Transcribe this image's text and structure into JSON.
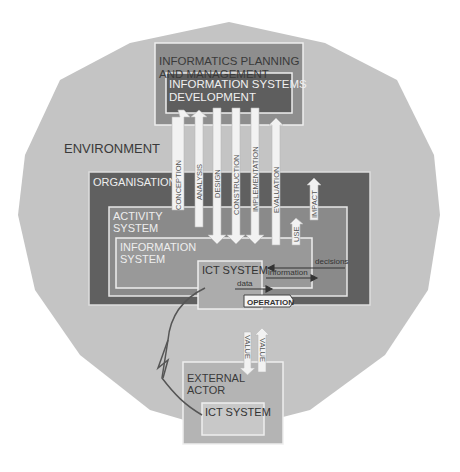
{
  "diagram": {
    "environment": {
      "label": "ENVIRONMENT"
    },
    "planning": {
      "line1": "INFORMATICS PLANNING",
      "line2": "AND MANAGEMENT"
    },
    "development": {
      "line1": "INFORMATION SYSTEMS",
      "line2": "DEVELOPMENT"
    },
    "organisation": {
      "label": "ORGANISATION"
    },
    "activity_system": {
      "line1": "ACTIVITY",
      "line2": "SYSTEM"
    },
    "information_system": {
      "line1": "INFORMATION",
      "line2": "SYSTEM"
    },
    "ict_system_inner": {
      "label": "ICT SYSTEM"
    },
    "external_actor": {
      "line1": "EXTERNAL",
      "line2": "ACTOR"
    },
    "ict_system_external": {
      "label": "ICT SYSTEM"
    },
    "phases": [
      {
        "label": "CONCEPTION",
        "direction": "up"
      },
      {
        "label": "ANALYSIS",
        "direction": "up"
      },
      {
        "label": "DESIGN",
        "direction": "down"
      },
      {
        "label": "CONSTRUCTION",
        "direction": "down"
      },
      {
        "label": "IMPLEMENTATION",
        "direction": "down"
      },
      {
        "label": "EVALUATION",
        "direction": "up"
      }
    ],
    "use": {
      "label": "USE"
    },
    "impact": {
      "label": "IMPACT"
    },
    "flows": {
      "decisions": "decisions",
      "information": "information",
      "data": "data",
      "operation": "OPERATION"
    },
    "value_arrows": [
      {
        "label": "VALUE",
        "direction": "down"
      },
      {
        "label": "VALUE",
        "direction": "up"
      }
    ],
    "colors": {
      "environment": "#c4c4c4",
      "planning": "#8e8e8e",
      "development": "#5e5e5e",
      "organisation": "#606060",
      "activity": "#8a8a8a",
      "information_system": "#999999",
      "ict_inner": "#acacac",
      "external_actor": "#b4b4b4",
      "ict_external": "#c8c8c8",
      "arrow_fill": "#f2f2f2",
      "border": "#eeeeee"
    }
  }
}
